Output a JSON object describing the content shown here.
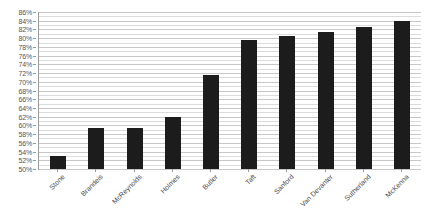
{
  "chart_data": {
    "type": "bar",
    "title": "",
    "subtitle": "",
    "xlabel": "",
    "ylabel": "",
    "categories": [
      "Stone",
      "Brandeis",
      "McReynolds",
      "Holmes",
      "Butler",
      "Taft",
      "Sanford",
      "Van Devanter",
      "Sutherland",
      "McKenna"
    ],
    "values": [
      53,
      59.5,
      59.5,
      62,
      71.5,
      79.5,
      80.5,
      81.5,
      82.5,
      84
    ],
    "ylim": [
      50,
      86
    ],
    "y_tick_step": 2,
    "y_minor_step": 1,
    "y_tick_labels": [
      "50%",
      "52%",
      "54%",
      "56%",
      "58%",
      "60%",
      "62%",
      "64%",
      "66%",
      "68%",
      "70%",
      "72%",
      "74%",
      "76%",
      "78%",
      "80%",
      "82%",
      "84%",
      "86%"
    ],
    "y_tick_values": [
      50,
      52,
      54,
      56,
      58,
      60,
      62,
      64,
      66,
      68,
      70,
      72,
      74,
      76,
      78,
      80,
      82,
      84,
      86
    ],
    "grid": true,
    "grid_axis": "y",
    "legend": false,
    "legend_position": "none",
    "bar_color": "#1c1c1c",
    "grid_color": "#c8c8c8",
    "minor_grid_color": "#dcdcdc",
    "axis_color": "#9a9a9a",
    "label_color": "#555555",
    "background_color": "#ffffff",
    "x_label_rotation": -45
  }
}
